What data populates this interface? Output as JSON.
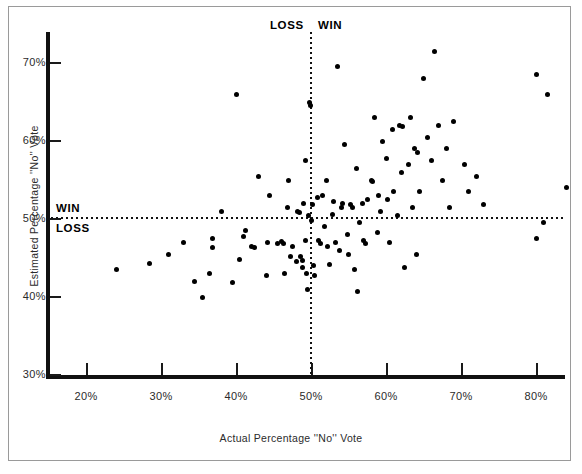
{
  "chart_data": {
    "type": "scatter",
    "title": "",
    "xlabel": "Actual Percentage ''No'' Vote",
    "ylabel": "Estimated Percentage ''No'' Vote",
    "xlim": [
      15,
      88
    ],
    "ylim": [
      29.5,
      74
    ],
    "grid": false,
    "legend": null,
    "xticks": [
      20,
      30,
      40,
      50,
      60,
      70,
      80
    ],
    "xtick_labels": [
      "20%",
      "30%",
      "40%",
      "50%",
      "60%",
      "70%",
      "80%"
    ],
    "yticks": [
      30,
      40,
      50,
      60,
      70
    ],
    "ytick_labels": [
      "30%",
      "40%",
      "50%",
      "60%",
      "70%"
    ],
    "reference_lines": [
      {
        "orientation": "horizontal",
        "value": 50,
        "style": "dotted"
      },
      {
        "orientation": "vertical",
        "value": 50,
        "style": "dotted"
      }
    ],
    "annotations": [
      {
        "text": "LOSS",
        "x": 45,
        "y": 73.2,
        "name": "top-loss"
      },
      {
        "text": "WIN",
        "x": 51.5,
        "y": 73.2,
        "name": "top-win"
      },
      {
        "text": "WIN",
        "x": 16.5,
        "y": 51.8,
        "name": "mid-win"
      },
      {
        "text": "LOSS",
        "x": 16.5,
        "y": 49.2,
        "name": "mid-loss"
      }
    ],
    "points": [
      [
        24.0,
        43.5
      ],
      [
        28.5,
        44.3
      ],
      [
        31.0,
        45.5
      ],
      [
        33.0,
        47.0
      ],
      [
        34.5,
        42.0
      ],
      [
        35.5,
        40.0
      ],
      [
        36.5,
        43.0
      ],
      [
        36.8,
        47.5
      ],
      [
        36.9,
        46.3
      ],
      [
        38.0,
        51.0
      ],
      [
        39.5,
        41.8
      ],
      [
        40.0,
        66.0
      ],
      [
        40.5,
        44.8
      ],
      [
        41.0,
        47.8
      ],
      [
        41.2,
        48.5
      ],
      [
        42.0,
        46.5
      ],
      [
        42.5,
        46.4
      ],
      [
        43.0,
        55.5
      ],
      [
        44.0,
        42.8
      ],
      [
        44.2,
        47.0
      ],
      [
        44.5,
        53.0
      ],
      [
        45.5,
        46.9
      ],
      [
        46.0,
        47.1
      ],
      [
        46.3,
        46.8
      ],
      [
        46.5,
        43.0
      ],
      [
        46.8,
        51.5
      ],
      [
        47.0,
        55.0
      ],
      [
        47.2,
        45.2
      ],
      [
        47.5,
        46.5
      ],
      [
        48.0,
        44.5
      ],
      [
        48.2,
        51.0
      ],
      [
        48.5,
        50.8
      ],
      [
        48.6,
        45.2
      ],
      [
        48.8,
        44.7
      ],
      [
        48.9,
        43.8
      ],
      [
        49.0,
        52.0
      ],
      [
        49.2,
        57.5
      ],
      [
        49.3,
        47.2
      ],
      [
        49.4,
        43.0
      ],
      [
        49.5,
        41.0
      ],
      [
        49.6,
        50.5
      ],
      [
        49.8,
        65.0
      ],
      [
        49.9,
        64.5
      ],
      [
        50.0,
        49.8
      ],
      [
        50.2,
        51.8
      ],
      [
        50.3,
        44.0
      ],
      [
        50.5,
        42.8
      ],
      [
        50.8,
        52.8
      ],
      [
        51.0,
        47.2
      ],
      [
        51.2,
        46.9
      ],
      [
        51.5,
        53.0
      ],
      [
        51.8,
        49.0
      ],
      [
        52.0,
        55.0
      ],
      [
        52.2,
        46.5
      ],
      [
        52.5,
        44.2
      ],
      [
        52.8,
        50.6
      ],
      [
        53.0,
        52.2
      ],
      [
        53.2,
        47.0
      ],
      [
        53.5,
        69.5
      ],
      [
        53.8,
        46.0
      ],
      [
        54.0,
        51.5
      ],
      [
        54.2,
        52.0
      ],
      [
        54.5,
        59.5
      ],
      [
        54.8,
        48.0
      ],
      [
        55.0,
        45.5
      ],
      [
        55.2,
        51.8
      ],
      [
        55.5,
        51.5
      ],
      [
        55.8,
        43.5
      ],
      [
        56.0,
        56.5
      ],
      [
        56.2,
        40.7
      ],
      [
        56.5,
        49.5
      ],
      [
        56.8,
        52.0
      ],
      [
        57.0,
        47.2
      ],
      [
        57.2,
        46.8
      ],
      [
        57.5,
        52.5
      ],
      [
        58.0,
        55.0
      ],
      [
        58.2,
        54.8
      ],
      [
        58.5,
        63.0
      ],
      [
        58.8,
        48.3
      ],
      [
        59.0,
        53.0
      ],
      [
        59.2,
        51.0
      ],
      [
        59.5,
        60.0
      ],
      [
        60.0,
        57.8
      ],
      [
        60.2,
        52.5
      ],
      [
        60.5,
        47.0
      ],
      [
        60.8,
        61.5
      ],
      [
        61.0,
        53.5
      ],
      [
        61.5,
        50.5
      ],
      [
        61.8,
        62.0
      ],
      [
        62.0,
        56.0
      ],
      [
        62.2,
        61.8
      ],
      [
        62.5,
        43.8
      ],
      [
        63.0,
        57.0
      ],
      [
        63.2,
        63.0
      ],
      [
        63.5,
        51.5
      ],
      [
        63.8,
        59.0
      ],
      [
        64.0,
        45.5
      ],
      [
        64.2,
        58.5
      ],
      [
        64.5,
        53.5
      ],
      [
        65.0,
        68.0
      ],
      [
        65.5,
        60.5
      ],
      [
        66.0,
        57.5
      ],
      [
        66.5,
        71.5
      ],
      [
        67.0,
        62.0
      ],
      [
        67.5,
        55.0
      ],
      [
        68.0,
        59.0
      ],
      [
        68.5,
        51.5
      ],
      [
        69.0,
        62.5
      ],
      [
        70.5,
        57.0
      ],
      [
        71.0,
        53.5
      ],
      [
        72.0,
        55.5
      ],
      [
        73.0,
        51.8
      ],
      [
        80.0,
        68.5
      ],
      [
        81.5,
        66.0
      ],
      [
        84.0,
        54.0
      ],
      [
        81.0,
        49.5
      ],
      [
        80.0,
        47.5
      ]
    ]
  },
  "labels": {
    "xaxis_title": "Actual Percentage ''No'' Vote",
    "yaxis_title": "Estimated Percentage ''No'' Vote"
  }
}
